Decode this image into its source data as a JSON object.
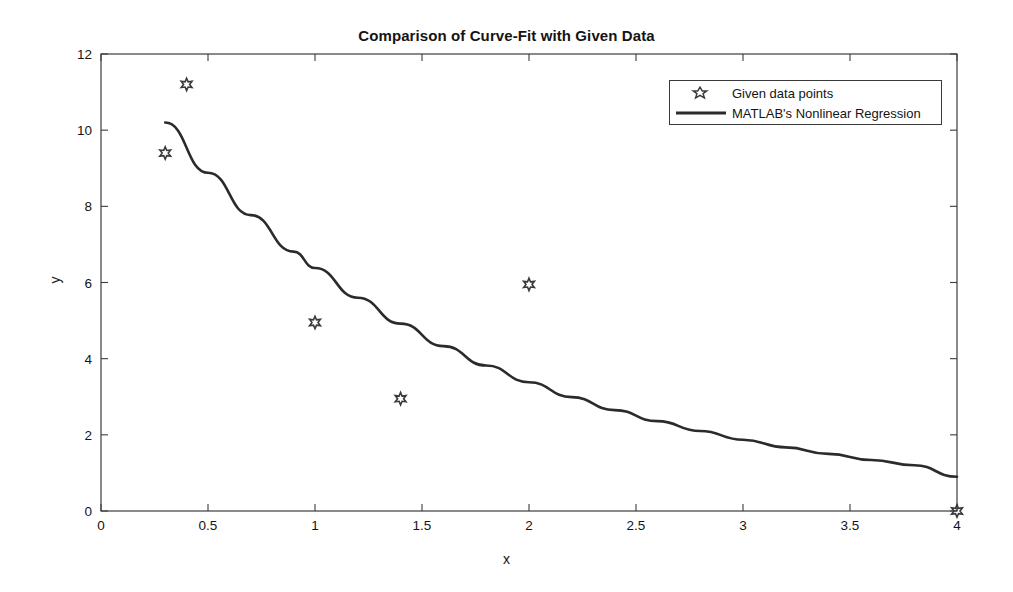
{
  "chart_data": {
    "type": "scatter",
    "title": "Comparison of Curve-Fit with Given Data",
    "xlabel": "x",
    "ylabel": "y",
    "xlim": [
      0,
      4
    ],
    "ylim": [
      0,
      12
    ],
    "xticks": [
      "0",
      "0.5",
      "1",
      "1.5",
      "2",
      "2.5",
      "3",
      "3.5",
      "4"
    ],
    "xtick_values": [
      0,
      0.5,
      1,
      1.5,
      2,
      2.5,
      3,
      3.5,
      4
    ],
    "yticks": [
      "0",
      "2",
      "4",
      "6",
      "8",
      "10",
      "12"
    ],
    "ytick_values": [
      0,
      2,
      4,
      6,
      8,
      10,
      12
    ],
    "grid": false,
    "legend_position": "top-right",
    "series": [
      {
        "name": "Given data points",
        "type": "scatter",
        "marker": "hexagram-open",
        "color": "#3a3a3a",
        "x": [
          0.3,
          0.4,
          1.0,
          1.4,
          2.0,
          4.0
        ],
        "y": [
          9.4,
          11.2,
          4.95,
          2.95,
          5.95,
          0.0
        ]
      },
      {
        "name": "MATLAB's Nonlinear Regression",
        "type": "line",
        "color": "#2b2b2b",
        "line_width": 2.6,
        "x": [
          0.3,
          0.5,
          0.7,
          0.9,
          1.0,
          1.2,
          1.4,
          1.6,
          1.8,
          2.0,
          2.2,
          2.4,
          2.6,
          2.8,
          3.0,
          3.2,
          3.4,
          3.6,
          3.8,
          4.0
        ],
        "y": [
          10.2,
          8.88,
          7.77,
          6.81,
          6.38,
          5.6,
          4.92,
          4.33,
          3.82,
          3.38,
          2.99,
          2.65,
          2.36,
          2.1,
          1.87,
          1.67,
          1.5,
          1.34,
          1.2,
          0.9
        ]
      }
    ]
  },
  "legend": {
    "entries": [
      {
        "label": "Given data points",
        "key": "marker"
      },
      {
        "label": "MATLAB's Nonlinear Regression",
        "key": "line"
      }
    ]
  }
}
